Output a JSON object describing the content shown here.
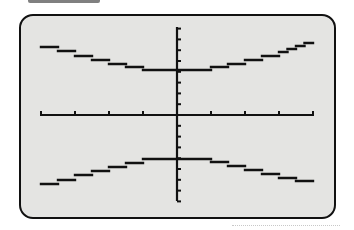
{
  "screen": {
    "type": "graphing-calculator-display",
    "background": "#e4e4e2",
    "border_color": "#111111",
    "ink_color": "#111111"
  },
  "chart_data": {
    "type": "line",
    "title": "",
    "xlabel": "",
    "ylabel": "",
    "equation_estimate": "y^2/16 - x^2/9.3 = 1",
    "xlim": [
      -4,
      4
    ],
    "ylim": [
      -8,
      8
    ],
    "x_ticks": [
      -4,
      -3,
      -2,
      -1,
      1,
      2,
      3,
      4
    ],
    "y_ticks": [
      -8,
      -7,
      -6,
      -5,
      -4,
      -3,
      -2,
      -1,
      1,
      2,
      3,
      4,
      5,
      6,
      7,
      8
    ],
    "grid": false,
    "legend": null,
    "series": [
      {
        "name": "upper branch",
        "x": [
          -4,
          -3.5,
          -3,
          -2.5,
          -2,
          -1.5,
          -1,
          0,
          1,
          1.5,
          2,
          2.5,
          3,
          3.5,
          4
        ],
        "y": [
          6.5,
          6.1,
          5.7,
          5.3,
          4.9,
          4.6,
          4.2,
          4.1,
          4.2,
          4.6,
          4.9,
          5.3,
          5.7,
          6.2,
          6.8
        ]
      },
      {
        "name": "lower branch",
        "x": [
          -4,
          -3.5,
          -3,
          -2.5,
          -2,
          -1.5,
          -1,
          0,
          1,
          1.5,
          2,
          2.5,
          3,
          3.5,
          4
        ],
        "y": [
          -6.6,
          -6.2,
          -5.8,
          -5.4,
          -5.0,
          -4.6,
          -4.2,
          -4.0,
          -4.2,
          -4.5,
          -4.9,
          -5.3,
          -5.6,
          -6.0,
          -6.3
        ]
      }
    ]
  }
}
